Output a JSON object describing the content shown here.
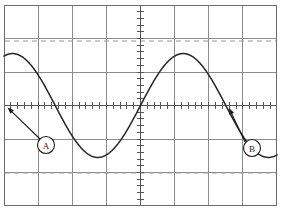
{
  "figure": {
    "width": 281,
    "height": 212,
    "background_color": "#ffffff"
  },
  "graticule": {
    "name": "graticule",
    "border_color": "#6b6b6b",
    "grid_color": "#8c8c8c",
    "axis_color": "#555555",
    "left": 4,
    "top": 5,
    "right": 277,
    "bottom": 206,
    "columns": 8,
    "rows": 6,
    "center_x": 140.5,
    "center_y": 105.5,
    "minor_divisions_per_division": 5,
    "tick_half_length": 3.2
  },
  "reference_lines": {
    "color": "#9a9a9a",
    "dash": "5,4",
    "upper": {
      "name": "upper-reference-line",
      "y": 41
    },
    "lower": {
      "name": "lower-reference-line",
      "y": 173
    }
  },
  "waveform": {
    "name": "sine-waveform",
    "color": "#262626",
    "stroke_width": 1.5,
    "amplitude_divisions": 1.55,
    "period_divisions": 5,
    "phase": "rising zero crossing at left edge"
  },
  "markers": [
    {
      "id": "A",
      "label": "A",
      "circle": {
        "cx": 46,
        "cy": 145,
        "r": 8.5
      },
      "arrow": {
        "x1": 40,
        "y1": 139,
        "x2": 7.5,
        "y2": 107.5
      },
      "color": "#1a1a1a"
    },
    {
      "id": "B",
      "label": "B",
      "circle": {
        "cx": 252,
        "cy": 148,
        "r": 8.5
      },
      "arrow": {
        "x1": 245,
        "y1": 142,
        "x2": 229,
        "y2": 108
      },
      "color": "#1a1a1a"
    }
  ],
  "chart_data": {
    "type": "line",
    "title": "",
    "xlabel": "",
    "ylabel": "",
    "xlim": [
      -4,
      4
    ],
    "ylim": [
      -3,
      3
    ],
    "grid": true,
    "legend": null,
    "x_unit": "division",
    "y_unit": "division",
    "series": [
      {
        "name": "sine",
        "function": "y = 1.55 * sin(2*pi*x/5)",
        "amplitude": 1.55,
        "period": 5,
        "x": [
          -4.0,
          -3.75,
          -3.5,
          -3.25,
          -3.0,
          -2.75,
          -2.5,
          -2.25,
          -2.0,
          -1.75,
          -1.5,
          -1.25,
          -1.0,
          -0.75,
          -0.5,
          -0.25,
          0.0,
          0.25,
          0.5,
          0.75,
          1.0,
          1.25,
          1.5,
          1.75,
          2.0,
          2.25,
          2.5,
          2.75,
          3.0,
          3.25,
          3.5,
          3.75,
          4.0
        ],
        "y": [
          0.0,
          0.47,
          0.91,
          1.25,
          1.46,
          1.54,
          1.47,
          1.26,
          0.92,
          0.48,
          0.0,
          -0.48,
          -0.92,
          -1.26,
          -1.47,
          -1.54,
          -1.46,
          -1.25,
          -0.91,
          -0.47,
          0.0,
          0.47,
          0.91,
          1.25,
          1.46,
          1.54,
          1.47,
          1.26,
          0.92,
          0.48,
          0.0,
          -0.48,
          -0.92
        ]
      }
    ],
    "annotations": [
      {
        "label": "A",
        "x": -4.0,
        "y": 0.0,
        "note": "rising zero crossing at left edge"
      },
      {
        "label": "B",
        "x": 2.6,
        "y": 0.0,
        "note": "rising zero crossing near right side"
      }
    ],
    "reference_levels": [
      1.93,
      -2.0
    ]
  }
}
